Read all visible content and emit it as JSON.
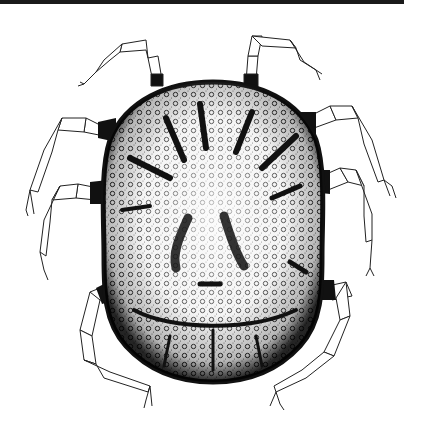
{
  "figure": {
    "alt": "Stippled line drawing of a mite with an oval, pitted dorsal shield bearing radiating dark grooves, and eight thin segmented legs (four per side).",
    "legs_per_side": 4,
    "colors": {
      "ink": "#111111",
      "paper": "#ffffff",
      "rule": "#1a1a1a",
      "stipple": "#333333"
    }
  },
  "page": {
    "top_rule": true
  }
}
